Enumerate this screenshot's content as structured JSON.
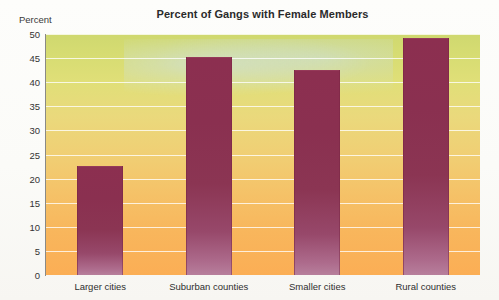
{
  "chart_data": {
    "type": "bar",
    "title": "Percent of Gangs with Female Members",
    "xlabel": "",
    "ylabel": "Percent",
    "categories": [
      "Larger cities",
      "Suburban counties",
      "Smaller cities",
      "Rural counties"
    ],
    "values": [
      22.7,
      45.3,
      42.5,
      49.2
    ],
    "ylim": [
      0,
      50
    ],
    "yticks": [
      0,
      5,
      10,
      15,
      20,
      25,
      30,
      35,
      40,
      45,
      50
    ],
    "ytick_labels": [
      "0",
      "5",
      "10",
      "15",
      "20",
      "25",
      "30",
      "35",
      "40",
      "45",
      "50"
    ],
    "grid": true,
    "legend": false,
    "colors": {
      "bar": "#8c2f50",
      "bar_bottom": "#b77f9c",
      "plot_top": "#cfd86f",
      "plot_bottom": "#fbae55",
      "gridline": "#ffffff",
      "axis": "#8a8a86",
      "text": "#2b2b2b"
    }
  }
}
